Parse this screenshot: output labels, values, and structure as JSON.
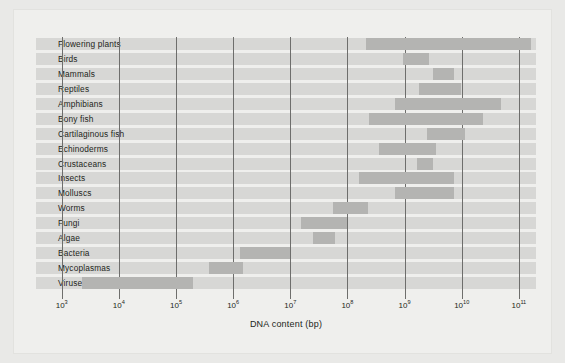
{
  "chart_data": {
    "type": "bar",
    "orientation": "horizontal",
    "title": "",
    "xlabel": "DNA content (bp)",
    "ylabel": "",
    "x_scale": "log10",
    "xlim": [
      2.55,
      11.3
    ],
    "grid": true,
    "legend": "none",
    "tick_labels": [
      "10",
      "10",
      "10",
      "10",
      "10",
      "10",
      "10",
      "10",
      "10"
    ],
    "tick_exponents": [
      "3",
      "4",
      "5",
      "6",
      "7",
      "8",
      "9",
      "10",
      "11"
    ],
    "tick_values": [
      3,
      4,
      5,
      6,
      7,
      8,
      9,
      10,
      11
    ],
    "value_units": "log10 base pairs",
    "categories": [
      "Flowering plants",
      "Birds",
      "Mammals",
      "Reptiles",
      "Amphibians",
      "Bony fish",
      "Cartilaginous fish",
      "Echinoderms",
      "Crustaceans",
      "Insects",
      "Molluscs",
      "Worms",
      "Fungi",
      "Algae",
      "Bacteria",
      "Mycoplasmas",
      "Viruses"
    ],
    "ranges": [
      {
        "category": "Flowering plants",
        "start": 8.33,
        "end": 11.21
      },
      {
        "category": "Birds",
        "start": 8.98,
        "end": 9.43
      },
      {
        "category": "Mammals",
        "start": 9.5,
        "end": 9.86
      },
      {
        "category": "Reptiles",
        "start": 9.26,
        "end": 9.98
      },
      {
        "category": "Amphibians",
        "start": 8.83,
        "end": 10.69
      },
      {
        "category": "Bony fish",
        "start": 8.38,
        "end": 10.38
      },
      {
        "category": "Cartilaginous fish",
        "start": 9.4,
        "end": 10.05
      },
      {
        "category": "Echinoderms",
        "start": 8.55,
        "end": 9.55
      },
      {
        "category": "Crustaceans",
        "start": 9.21,
        "end": 9.5
      },
      {
        "category": "Insects",
        "start": 8.21,
        "end": 9.86
      },
      {
        "category": "Molluscs",
        "start": 8.83,
        "end": 9.86
      },
      {
        "category": "Worms",
        "start": 7.74,
        "end": 8.36
      },
      {
        "category": "Fungi",
        "start": 7.19,
        "end": 8.0
      },
      {
        "category": "Algae",
        "start": 7.4,
        "end": 7.79
      },
      {
        "category": "Bacteria",
        "start": 6.12,
        "end": 7.0
      },
      {
        "category": "Mycoplasmas",
        "start": 5.57,
        "end": 6.17
      },
      {
        "category": "Viruses",
        "start": 3.36,
        "end": 5.29
      }
    ],
    "colors": {
      "bar": "#b4b4b2",
      "row_band": "#d7d7d5",
      "gridline": "#6e6e6c",
      "plot_background": "#efefed",
      "page_background": "#e9e9e7",
      "text": "#231f20"
    }
  }
}
